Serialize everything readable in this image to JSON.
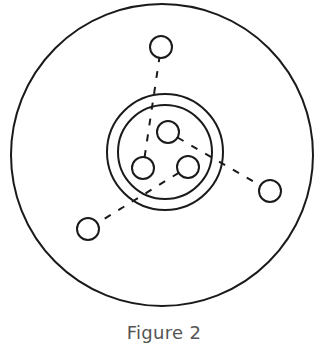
{
  "figure": {
    "caption": "Figure 2",
    "stroke_color": "#1a1a1a",
    "caption_color": "#555555",
    "outer_circle": {
      "cx": 162,
      "cy": 155,
      "r": 151
    },
    "ring": {
      "cx": 165,
      "cy": 152,
      "outer_r": 58,
      "inner_r": 47
    },
    "inner_nodes": [
      {
        "id": "inner-top",
        "cx": 168,
        "cy": 132,
        "r": 11
      },
      {
        "id": "inner-left",
        "cx": 143,
        "cy": 168,
        "r": 11
      },
      {
        "id": "inner-right",
        "cx": 188,
        "cy": 167,
        "r": 11
      }
    ],
    "outer_nodes": [
      {
        "id": "outer-top",
        "cx": 161,
        "cy": 47,
        "r": 11
      },
      {
        "id": "outer-right",
        "cx": 270,
        "cy": 191,
        "r": 11
      },
      {
        "id": "outer-left",
        "cx": 88,
        "cy": 229,
        "r": 11
      }
    ],
    "connections": [
      {
        "from": "inner-left",
        "to": "outer-top",
        "style": "dashed"
      },
      {
        "from": "inner-top",
        "to": "outer-right",
        "style": "dashed"
      },
      {
        "from": "inner-right",
        "to": "outer-left",
        "style": "dashed"
      }
    ]
  }
}
